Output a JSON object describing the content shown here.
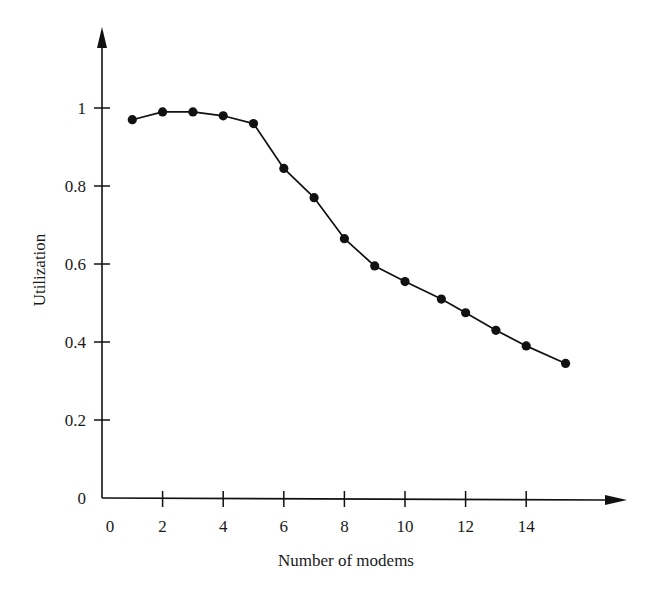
{
  "chart_data": {
    "type": "line",
    "title": "",
    "xlabel": "Number of modems",
    "ylabel": "Utilization",
    "x": [
      1,
      2,
      3,
      4,
      5,
      6,
      7,
      8,
      9,
      10,
      11.2,
      12,
      13,
      14,
      15.3
    ],
    "series": [
      {
        "name": "Utilization",
        "values": [
          0.97,
          0.99,
          0.99,
          0.98,
          0.96,
          0.845,
          0.77,
          0.665,
          0.595,
          0.555,
          0.51,
          0.475,
          0.43,
          0.39,
          0.345
        ],
        "marker": "filled-circle",
        "color": "#111111"
      }
    ],
    "xticks": [
      "0",
      "2",
      "4",
      "6",
      "8",
      "10",
      "12",
      "14"
    ],
    "yticks": [
      "0",
      "0.2",
      "0.4",
      "0.6",
      "0.8",
      "1"
    ],
    "xlim": [
      0,
      17.5
    ],
    "ylim": [
      0,
      1.2
    ],
    "grid": false,
    "legend": null
  },
  "colors": {
    "ink": "#111111",
    "background": "#ffffff"
  }
}
